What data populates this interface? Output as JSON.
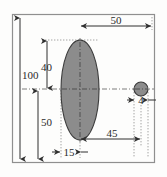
{
  "figure": {
    "kind": "engineering-dimension-drawing",
    "background_color": "#fdfdfc",
    "frame_color": "#8f8f8f",
    "shape_fill_color": "#8c8c8c",
    "shape_stroke_color": "#3b3b3b",
    "dimension_line_color": "#2f2f2f",
    "extension_line_color": "#9a9a9a",
    "centerline_color": "#6e6e6e"
  },
  "shapes": {
    "ellipse": {
      "name": "large-ellipse",
      "cx": 80,
      "cy": 90,
      "rx": 19,
      "ry": 50
    },
    "circle": {
      "name": "small-circle",
      "cx": 141,
      "cy": 89,
      "r": 7
    }
  },
  "dimensions": [
    {
      "id": "overall-height",
      "label": "100",
      "orientation": "vertical",
      "x": 22,
      "y": 75
    },
    {
      "id": "upper-height",
      "label": "40",
      "orientation": "vertical",
      "x": 48,
      "y": 67
    },
    {
      "id": "lower-height",
      "label": "50",
      "orientation": "vertical",
      "x": 48,
      "y": 122
    },
    {
      "id": "overall-width",
      "label": "50",
      "orientation": "horizontal",
      "x": 116,
      "y": 24
    },
    {
      "id": "center-offset",
      "label": "45",
      "orientation": "horizontal",
      "x": 113,
      "y": 139
    },
    {
      "id": "left-offset",
      "label": "15",
      "orientation": "horizontal",
      "x": 69,
      "y": 152
    },
    {
      "id": "circle-width",
      "label": "4",
      "orientation": "horizontal",
      "x": 141,
      "y": 104
    }
  ]
}
